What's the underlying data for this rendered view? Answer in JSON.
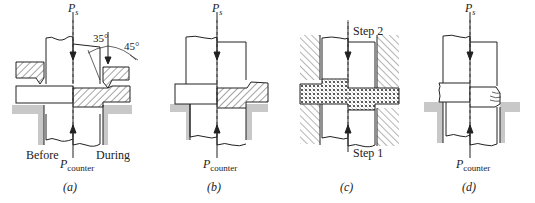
{
  "figure": {
    "panels": [
      {
        "id": "a",
        "caption": "(a)",
        "force_top": {
          "symbol": "P",
          "subscript": "s"
        },
        "force_bottom": {
          "symbol": "P",
          "subscript": "counter"
        },
        "left_label": "Before",
        "right_label": "During",
        "angles": [
          "35°",
          "45°"
        ]
      },
      {
        "id": "b",
        "caption": "(b)",
        "force_top": {
          "symbol": "P",
          "subscript": "s"
        },
        "force_bottom": {
          "symbol": "P",
          "subscript": "counter"
        }
      },
      {
        "id": "c",
        "caption": "(c)",
        "step_top": "Step 2",
        "step_bottom": "Step 1"
      },
      {
        "id": "d",
        "caption": "(d)",
        "force_top": {
          "symbol": "P",
          "subscript": "s"
        },
        "force_bottom": {
          "symbol": "P",
          "subscript": "counter"
        }
      }
    ]
  },
  "colors": {
    "line": "#222222",
    "die_fill": "#c8c8c8",
    "hatch": "#333333"
  }
}
